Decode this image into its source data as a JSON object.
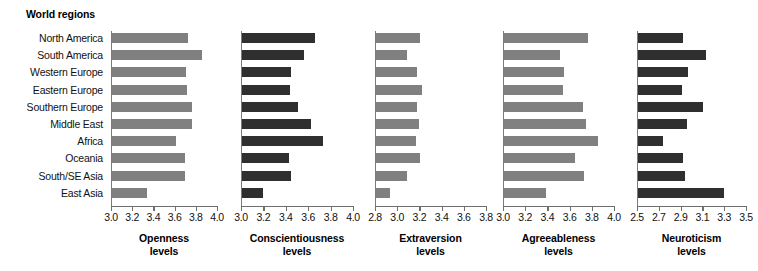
{
  "figure": {
    "regions_header": "World regions",
    "regions": [
      "North America",
      "South America",
      "Western Europe",
      "Eastern Europe",
      "Southern Europe",
      "Middle East",
      "Africa",
      "Oceania",
      "South/SE Asia",
      "East Asia"
    ],
    "colors": {
      "light_bar": "#808080",
      "dark_bar": "#2f2f2f",
      "axis": "#6f6f6f",
      "text": "#111111",
      "background": "#ffffff"
    }
  },
  "chart_data": {
    "type": "bar",
    "orientation": "horizontal",
    "title": "",
    "ylabel": "World regions",
    "grid": false,
    "legend": "none",
    "categories": [
      "North America",
      "South America",
      "Western Europe",
      "Eastern Europe",
      "Southern Europe",
      "Middle East",
      "Africa",
      "Oceania",
      "South/SE Asia",
      "East Asia"
    ],
    "panels": [
      {
        "name": "openness",
        "xlabel_line1": "Openness",
        "xlabel_line2": "levels",
        "color": "#808080",
        "xlim": [
          3.0,
          4.0
        ],
        "xticks": [
          3.0,
          3.2,
          3.4,
          3.6,
          3.8,
          4.0
        ],
        "xticklabels": [
          "3.0",
          "3.2",
          "3.4",
          "3.6",
          "3.8",
          "4.0"
        ],
        "values": [
          3.72,
          3.85,
          3.7,
          3.71,
          3.75,
          3.75,
          3.6,
          3.69,
          3.69,
          3.33
        ]
      },
      {
        "name": "conscientiousness",
        "xlabel_line1": "Conscientiousness",
        "xlabel_line2": "levels",
        "color": "#2f2f2f",
        "xlim": [
          3.0,
          4.0
        ],
        "xticks": [
          3.0,
          3.2,
          3.4,
          3.6,
          3.8,
          4.0
        ],
        "xticklabels": [
          "3.0",
          "3.2",
          "3.4",
          "3.6",
          "3.8",
          "4.0"
        ],
        "values": [
          3.65,
          3.55,
          3.44,
          3.43,
          3.5,
          3.62,
          3.72,
          3.42,
          3.44,
          3.19
        ]
      },
      {
        "name": "extraversion",
        "xlabel_line1": "Extraversion",
        "xlabel_line2": "levels",
        "color": "#808080",
        "xlim": [
          2.8,
          3.8
        ],
        "xticks": [
          2.8,
          3.0,
          3.2,
          3.4,
          3.6,
          3.8
        ],
        "xticklabels": [
          "2.8",
          "3.0",
          "3.2",
          "3.4",
          "3.6",
          "3.8"
        ],
        "values": [
          3.2,
          3.08,
          3.17,
          3.21,
          3.17,
          3.19,
          3.16,
          3.2,
          3.08,
          2.93
        ]
      },
      {
        "name": "agreeableness",
        "xlabel_line1": "Agreeableness",
        "xlabel_line2": "levels",
        "color": "#808080",
        "xlim": [
          3.0,
          4.0
        ],
        "xticks": [
          3.0,
          3.2,
          3.4,
          3.6,
          3.8,
          4.0
        ],
        "xticklabels": [
          "3.0",
          "3.2",
          "3.4",
          "3.6",
          "3.8",
          "4.0"
        ],
        "values": [
          3.76,
          3.5,
          3.54,
          3.53,
          3.71,
          3.74,
          3.85,
          3.64,
          3.72,
          3.38
        ]
      },
      {
        "name": "neuroticism",
        "xlabel_line1": "Neuroticism",
        "xlabel_line2": "levels",
        "color": "#2f2f2f",
        "xlim": [
          2.5,
          3.5
        ],
        "xticks": [
          2.5,
          2.7,
          2.9,
          3.1,
          3.3,
          3.5
        ],
        "xticklabels": [
          "2.5",
          "2.7",
          "2.9",
          "3.1",
          "3.3",
          "3.5"
        ],
        "values": [
          2.91,
          3.12,
          2.96,
          2.9,
          3.1,
          2.95,
          2.73,
          2.91,
          2.93,
          3.29
        ]
      }
    ]
  }
}
